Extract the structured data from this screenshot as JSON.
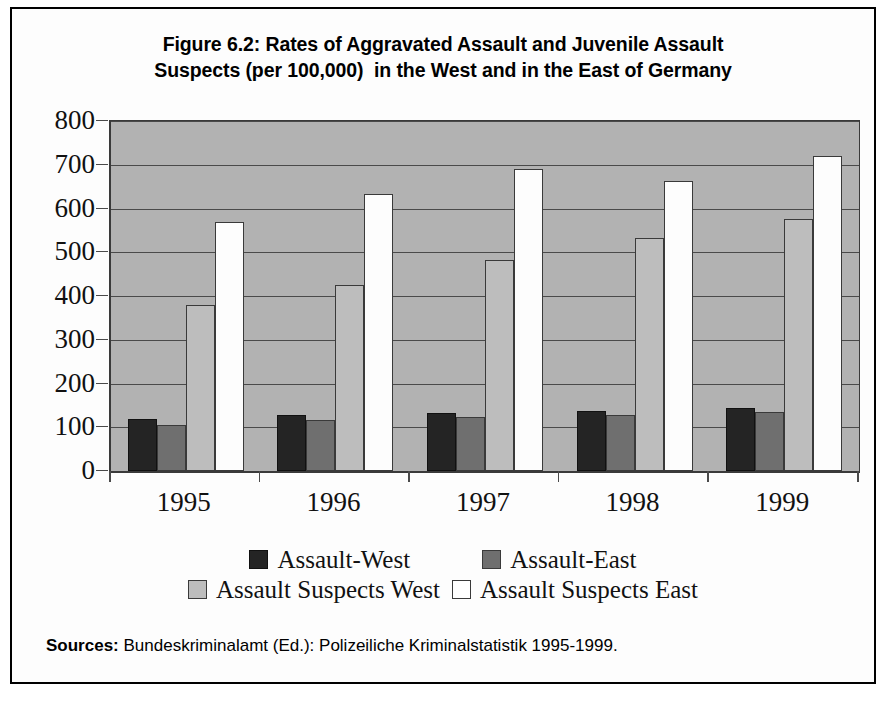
{
  "figure": {
    "title_line1": "Figure 6.2: Rates of Aggravated Assault and Juvenile Assault",
    "title_line2": "Suspects (per 100,000)  in the West and in the East of Germany",
    "source_label": "Sources:",
    "source_text": " Bundeskriminalamt (Ed.): Polizeiliche Kriminalstatistik 1995-1999.",
    "frame_color": "#000000"
  },
  "chart_data": {
    "type": "bar",
    "title": "Figure 6.2: Rates of Aggravated Assault and Juvenile Assault Suspects (per 100,000)  in the West and in the East of Germany",
    "xlabel": "",
    "ylabel": "",
    "categories": [
      "1995",
      "1996",
      "1997",
      "1998",
      "1999"
    ],
    "series": [
      {
        "name": "Assault-West",
        "color": "#242424",
        "values": [
          120,
          128,
          133,
          138,
          143
        ]
      },
      {
        "name": "Assault-East",
        "color": "#6f6f6f",
        "values": [
          105,
          117,
          123,
          127,
          135
        ]
      },
      {
        "name": "Assault Suspects West",
        "color": "#bdbdbd",
        "values": [
          380,
          425,
          483,
          532,
          575
        ]
      },
      {
        "name": "Assault Suspects East",
        "color": "#ffffff",
        "values": [
          570,
          634,
          690,
          664,
          719
        ]
      }
    ],
    "ylim": [
      0,
      800
    ],
    "ytick_values": [
      0,
      100,
      200,
      300,
      400,
      500,
      600,
      700,
      800
    ],
    "ytick_labels": [
      "0",
      "100",
      "200",
      "300",
      "400",
      "500",
      "600",
      "700",
      "800"
    ],
    "grid": true,
    "grid_axis": "y",
    "legend_position": "bottom",
    "plot_background": "#b2b2b2"
  }
}
